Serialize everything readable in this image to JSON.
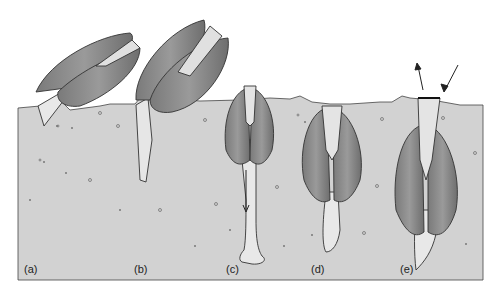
{
  "figure": {
    "colors": {
      "background": "#ffffff",
      "sediment": "#d2d2d2",
      "shell": "#8a8a8a",
      "shell_dark": "#5a5a5a",
      "foot": "#e6e6e6",
      "outline": "#333333"
    },
    "panels": [
      {
        "id": "a",
        "label": "(a)"
      },
      {
        "id": "b",
        "label": "(b)"
      },
      {
        "id": "c",
        "label": "(c)"
      },
      {
        "id": "d",
        "label": "(d)"
      },
      {
        "id": "e",
        "label": "(e)"
      }
    ]
  }
}
